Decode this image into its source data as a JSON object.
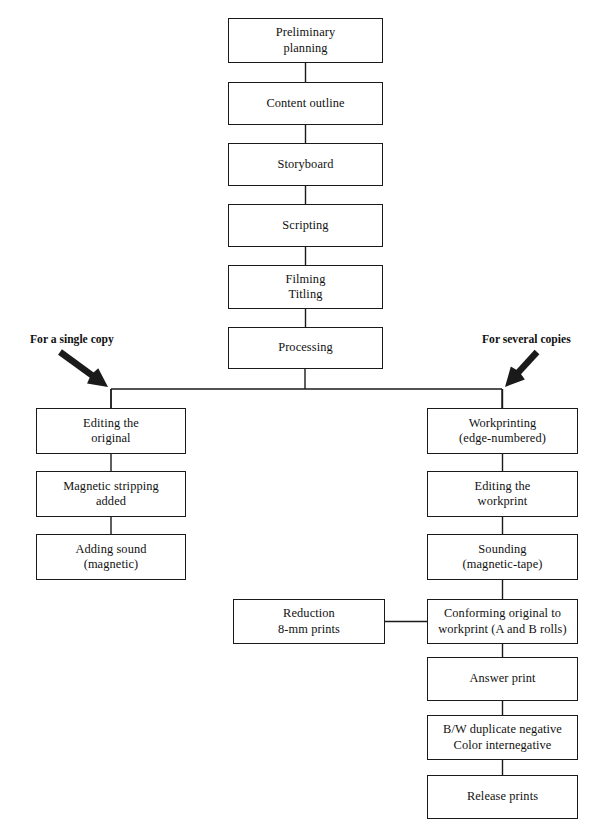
{
  "diagram": {
    "line_color": "#1a1a1a",
    "background": "#ffffff",
    "nodes": [
      {
        "id": "preliminary-planning",
        "text": "Preliminary\nplanning",
        "x": 228,
        "y": 18,
        "w": 155,
        "h": 45
      },
      {
        "id": "content-outline",
        "text": "Content outline",
        "x": 228,
        "y": 82,
        "w": 155,
        "h": 43
      },
      {
        "id": "storyboard",
        "text": "Storyboard",
        "x": 228,
        "y": 143,
        "w": 155,
        "h": 43
      },
      {
        "id": "scripting",
        "text": "Scripting",
        "x": 228,
        "y": 204,
        "w": 155,
        "h": 43
      },
      {
        "id": "filming-titling",
        "text": "Filming\nTitling",
        "x": 228,
        "y": 265,
        "w": 155,
        "h": 44
      },
      {
        "id": "processing",
        "text": "Processing",
        "x": 228,
        "y": 327,
        "w": 155,
        "h": 42
      },
      {
        "id": "editing-the-original",
        "text": "Editing the\noriginal",
        "x": 36,
        "y": 408,
        "w": 150,
        "h": 46
      },
      {
        "id": "magnetic-stripping",
        "text": "Magnetic stripping\nadded",
        "x": 36,
        "y": 471,
        "w": 150,
        "h": 46
      },
      {
        "id": "adding-sound",
        "text": "Adding sound\n(magnetic)",
        "x": 36,
        "y": 534,
        "w": 150,
        "h": 46
      },
      {
        "id": "workprinting",
        "text": "Workprinting\n(edge-numbered)",
        "x": 427,
        "y": 408,
        "w": 151,
        "h": 46
      },
      {
        "id": "editing-the-workprint",
        "text": "Editing the\nworkprint",
        "x": 427,
        "y": 471,
        "w": 151,
        "h": 46
      },
      {
        "id": "sounding",
        "text": "Sounding\n(magnetic-tape)",
        "x": 427,
        "y": 534,
        "w": 151,
        "h": 46
      },
      {
        "id": "reduction",
        "text": "Reduction\n8-mm prints",
        "x": 233,
        "y": 599,
        "w": 152,
        "h": 45
      },
      {
        "id": "conforming-original",
        "text": "Conforming original to\nworkprint (A and B rolls)",
        "x": 427,
        "y": 599,
        "w": 151,
        "h": 45
      },
      {
        "id": "answer-print",
        "text": "Answer print",
        "x": 427,
        "y": 657,
        "w": 151,
        "h": 44
      },
      {
        "id": "duplicate-negative",
        "text": "B/W duplicate negative\nColor internegative",
        "x": 427,
        "y": 715,
        "w": 151,
        "h": 45
      },
      {
        "id": "release-prints",
        "text": "Release prints",
        "x": 427,
        "y": 775,
        "w": 151,
        "h": 44
      }
    ],
    "branch_labels": [
      {
        "id": "for-a-single-copy",
        "text": "For a single copy",
        "x": 30,
        "y": 333
      },
      {
        "id": "for-several-copies",
        "text": "For several copies",
        "x": 482,
        "y": 333
      }
    ],
    "arrows": [
      {
        "id": "arrow-single-copy",
        "direction": "down-right",
        "x1": 60,
        "y1": 352,
        "x2": 108,
        "y2": 387
      },
      {
        "id": "arrow-several-copies",
        "direction": "down-left",
        "x1": 537,
        "y1": 352,
        "x2": 505,
        "y2": 387
      }
    ],
    "connectors": [
      {
        "id": "edge-preliminary-to-content",
        "from": "preliminary-planning",
        "to": "content-outline",
        "type": "vertical"
      },
      {
        "id": "edge-content-to-storyboard",
        "from": "content-outline",
        "to": "storyboard",
        "type": "vertical"
      },
      {
        "id": "edge-storyboard-to-scripting",
        "from": "storyboard",
        "to": "scripting",
        "type": "vertical"
      },
      {
        "id": "edge-scripting-to-filming",
        "from": "scripting",
        "to": "filming-titling",
        "type": "vertical"
      },
      {
        "id": "edge-filming-to-processing",
        "from": "filming-titling",
        "to": "processing",
        "type": "vertical"
      },
      {
        "id": "edge-processing-split",
        "from": "processing",
        "to": "split-bar",
        "type": "split"
      },
      {
        "id": "edge-split-to-editing",
        "from": "split-bar",
        "to": "editing-the-original",
        "type": "vertical"
      },
      {
        "id": "edge-split-to-workprinting",
        "from": "split-bar",
        "to": "workprinting",
        "type": "vertical"
      },
      {
        "id": "edge-editing-to-stripping",
        "from": "editing-the-original",
        "to": "magnetic-stripping",
        "type": "vertical"
      },
      {
        "id": "edge-stripping-to-sound",
        "from": "magnetic-stripping",
        "to": "adding-sound",
        "type": "vertical"
      },
      {
        "id": "edge-workprinting-to-editing",
        "from": "workprinting",
        "to": "editing-the-workprint",
        "type": "vertical"
      },
      {
        "id": "edge-editing-to-sounding",
        "from": "editing-the-workprint",
        "to": "sounding",
        "type": "vertical"
      },
      {
        "id": "edge-sounding-to-conforming",
        "from": "sounding",
        "to": "conforming-original",
        "type": "vertical"
      },
      {
        "id": "edge-reduction-to-conforming",
        "from": "reduction",
        "to": "conforming-original",
        "type": "horizontal"
      },
      {
        "id": "edge-conforming-to-answer",
        "from": "conforming-original",
        "to": "answer-print",
        "type": "vertical"
      },
      {
        "id": "edge-answer-to-duplicate",
        "from": "answer-print",
        "to": "duplicate-negative",
        "type": "vertical"
      },
      {
        "id": "edge-duplicate-to-release",
        "from": "duplicate-negative",
        "to": "release-prints",
        "type": "vertical"
      }
    ],
    "split_bar": {
      "id": "split-bar",
      "y": 389,
      "x_left": 111,
      "x_right": 502,
      "from_x": 305
    }
  }
}
